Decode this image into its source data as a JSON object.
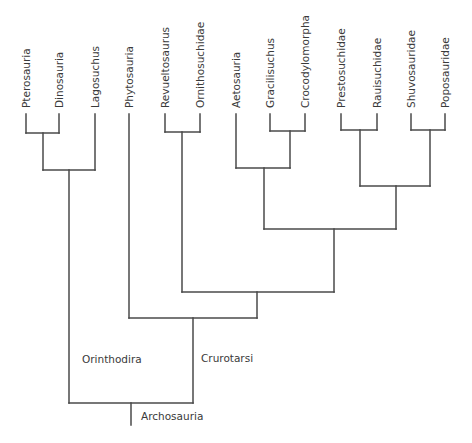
{
  "diagram": {
    "type": "cladogram",
    "root_label": "Archosauria",
    "line_color": "#4a4a4a",
    "text_color": "#3a3a3a",
    "leaves": [
      {
        "id": "pterosauria",
        "label": "Pterosauria",
        "x": 26
      },
      {
        "id": "dinosauria",
        "label": "Dinosauria",
        "x": 59
      },
      {
        "id": "lagosuchus",
        "label": "Lagosuchus",
        "x": 95
      },
      {
        "id": "phytosauria",
        "label": "Phytosauria",
        "x": 129
      },
      {
        "id": "revueltosaurus",
        "label": "Revueltosaurus",
        "x": 165
      },
      {
        "id": "ornithosuchidae",
        "label": "Ornithosuchidae",
        "x": 200
      },
      {
        "id": "aetosauria",
        "label": "Aetosauria",
        "x": 236
      },
      {
        "id": "gracilisuchus",
        "label": "Gracilisuchus",
        "x": 270
      },
      {
        "id": "crocodylomorpha",
        "label": "Crocodylomorpha",
        "x": 305
      },
      {
        "id": "prestosuchidae",
        "label": "Prestosuchidae",
        "x": 341
      },
      {
        "id": "rauisuchidae",
        "label": "Rauisuchidae",
        "x": 377
      },
      {
        "id": "shuvosauridae",
        "label": "Shuvosauridae",
        "x": 411
      },
      {
        "id": "poposauridae",
        "label": "Poposauridae",
        "x": 445
      }
    ],
    "clade_labels": {
      "orinthodira": "Orinthodira",
      "crurotarsi": "Crurotarsi",
      "archosauria": "Archosauria"
    },
    "topology": "(((Pterosauria,Dinosauria),Lagosuchus),(Phytosauria,((Revueltosaurus,Ornithosuchidae),((Aetosauria,(Gracilisuchus,Crocodylomorpha)),((Prestosuchidae,Rauisuchidae),(Shuvosauridae,Poposauridae))))))"
  }
}
